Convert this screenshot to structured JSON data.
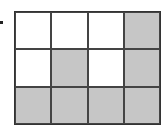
{
  "figure": {
    "rows": 3,
    "cols": 4,
    "shaded_color": "#c6c6c6",
    "unshaded_color": "#ffffff",
    "cells": [
      [
        false,
        false,
        false,
        true
      ],
      [
        false,
        true,
        false,
        true
      ],
      [
        true,
        true,
        true,
        true
      ]
    ],
    "shaded_count": 7,
    "total_count": 12
  }
}
